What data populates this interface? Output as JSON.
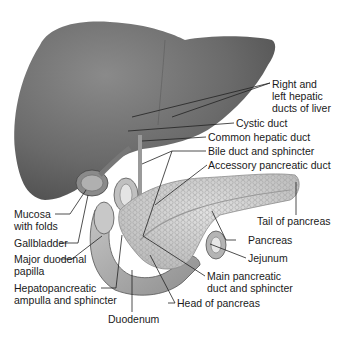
{
  "diagram": {
    "labels": {
      "right_left_hepatic": [
        "Right and",
        "left hepatic",
        "ducts of liver"
      ],
      "cystic_duct": "Cystic duct",
      "common_hepatic_duct": "Common hepatic duct",
      "bile_duct": "Bile duct and sphincter",
      "accessory_pancreatic_duct": "Accessory pancreatic duct",
      "mucosa": [
        "Mucosa",
        "with folds"
      ],
      "gallbladder": "Gallbladder",
      "major_duodenal_papilla": [
        "Major duodenal",
        "papilla"
      ],
      "hepatopancreatic_ampulla": [
        "Hepatopancreatic",
        "ampulla and sphincter"
      ],
      "duodenum": "Duodenum",
      "head_of_pancreas": "Head of pancreas",
      "main_pancreatic_duct": [
        "Main pancreatic",
        "duct and sphincter"
      ],
      "jejunum": "Jejunum",
      "pancreas": "Pancreas",
      "tail_of_pancreas": "Tail of pancreas"
    },
    "colors": {
      "liver": "#6e6e6e",
      "pancreas": "#d2d2d2",
      "duodenum": "#a8a8a8",
      "leader_line": "#222222"
    }
  }
}
